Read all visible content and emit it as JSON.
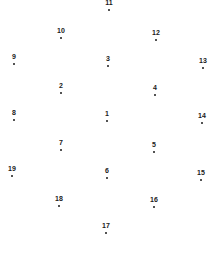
{
  "diagram": {
    "type": "numbered-point-layout",
    "background": "#ffffff",
    "ink_color": "#1a1a1a",
    "points": [
      {
        "label": "1",
        "x": 107,
        "y": 121
      },
      {
        "label": "2",
        "x": 61,
        "y": 93
      },
      {
        "label": "3",
        "x": 108,
        "y": 66
      },
      {
        "label": "4",
        "x": 155,
        "y": 95
      },
      {
        "label": "5",
        "x": 154,
        "y": 152
      },
      {
        "label": "6",
        "x": 107,
        "y": 178
      },
      {
        "label": "7",
        "x": 61,
        "y": 150
      },
      {
        "label": "8",
        "x": 14,
        "y": 120
      },
      {
        "label": "9",
        "x": 14,
        "y": 64
      },
      {
        "label": "10",
        "x": 61,
        "y": 38
      },
      {
        "label": "11",
        "x": 109,
        "y": 10
      },
      {
        "label": "12",
        "x": 156,
        "y": 40
      },
      {
        "label": "13",
        "x": 203,
        "y": 68
      },
      {
        "label": "14",
        "x": 202,
        "y": 123
      },
      {
        "label": "15",
        "x": 201,
        "y": 180
      },
      {
        "label": "16",
        "x": 154,
        "y": 207
      },
      {
        "label": "17",
        "x": 106,
        "y": 233
      },
      {
        "label": "18",
        "x": 59,
        "y": 206
      },
      {
        "label": "19",
        "x": 12,
        "y": 176
      }
    ]
  }
}
